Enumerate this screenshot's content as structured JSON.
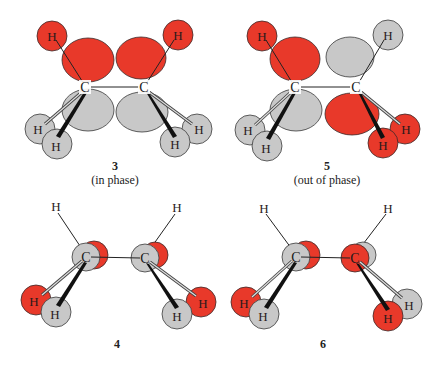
{
  "colors": {
    "red": "#e8392a",
    "grey": "#c8c8c8",
    "outline": "#3a3a3a",
    "bond": "#222222"
  },
  "atoms": {
    "carbon": "C",
    "hydrogen": "H"
  },
  "panels": [
    {
      "id": "3",
      "number": "3",
      "caption": "(in phase)"
    },
    {
      "id": "5",
      "number": "5",
      "caption": "(out of phase)"
    },
    {
      "id": "4",
      "number": "4",
      "caption": ""
    },
    {
      "id": "6",
      "number": "6",
      "caption": ""
    }
  ]
}
